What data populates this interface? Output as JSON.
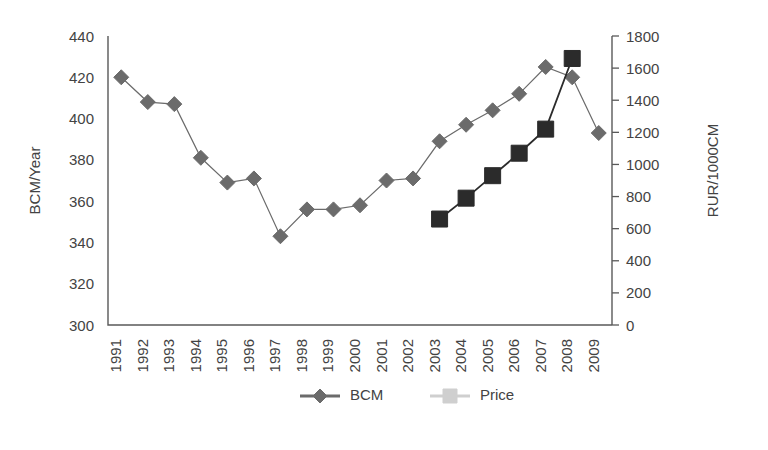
{
  "chart_data": {
    "type": "line",
    "title": "",
    "xlabel": "",
    "ylabel": "BCM/Year",
    "y2label": "RUR/1000CM",
    "grid": false,
    "legend_position": "bottom-center",
    "categories": [
      "1991",
      "1992",
      "1993",
      "1994",
      "1995",
      "1996",
      "1997",
      "1998",
      "1999",
      "2000",
      "2001",
      "2002",
      "2003",
      "2004",
      "2005",
      "2006",
      "2007",
      "2008",
      "2009"
    ],
    "yticks": [
      300,
      320,
      340,
      360,
      380,
      400,
      420,
      440
    ],
    "ylim": [
      300,
      440
    ],
    "y2ticks": [
      0,
      200,
      400,
      600,
      800,
      1000,
      1200,
      1400,
      1600,
      1800
    ],
    "y2lim": [
      0,
      1800
    ],
    "series": [
      {
        "name": "BCM",
        "axis": "left",
        "color": "#6b6b6b",
        "marker": "diamond",
        "values": [
          420,
          408,
          407,
          381,
          369,
          371,
          343,
          356,
          356,
          358,
          370,
          371,
          389,
          397,
          404,
          412,
          425,
          420,
          393
        ]
      },
      {
        "name": "Price",
        "axis": "right",
        "color": "#2b2b2b",
        "marker": "square",
        "values": [
          null,
          null,
          null,
          null,
          null,
          null,
          null,
          null,
          null,
          null,
          null,
          null,
          660,
          790,
          930,
          1070,
          1220,
          1660,
          null
        ]
      }
    ]
  },
  "legend": {
    "items": [
      {
        "label": "BCM",
        "color": "#6b6b6b",
        "marker": "diamond"
      },
      {
        "label": "Price",
        "color": "#cfcfcf",
        "marker": "square"
      }
    ]
  },
  "axes": {
    "left_title": "BCM/Year",
    "right_title": "RUR/1000CM"
  }
}
